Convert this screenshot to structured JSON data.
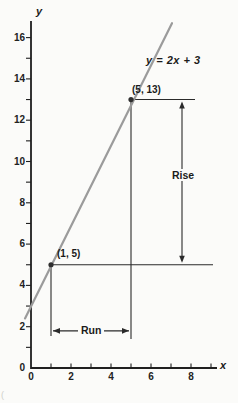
{
  "figure": {
    "background": "#fbfbf9",
    "caption_fragment": "(",
    "labels": {
      "equation": "y = 2x + 3",
      "point_upper": "(5, 13)",
      "point_lower": "(1, 5)",
      "rise": "Rise",
      "run": "Run",
      "x_axis_letter": "x",
      "y_axis_letter": "y"
    }
  },
  "chart_data": {
    "type": "line",
    "title": "",
    "equation": "y = 2x + 3",
    "slope": 2,
    "y_intercept": 3,
    "rise_value": 8,
    "run_value": 4,
    "points": [
      {
        "x": 1,
        "y": 5,
        "label": "(1, 5)"
      },
      {
        "x": 5,
        "y": 13,
        "label": "(5, 13)"
      }
    ],
    "line_segment": {
      "x1": -0.3,
      "y1": 2.4,
      "x2": 7.05,
      "y2": 16.7
    },
    "x_axis": {
      "label": "x",
      "range": [
        0,
        9.3
      ],
      "tick_step": 1,
      "labeled_ticks": [
        "0",
        "2",
        "4",
        "6",
        "8"
      ]
    },
    "y_axis": {
      "label": "y",
      "range": [
        0,
        16.8
      ],
      "tick_step": 1,
      "labeled_ticks": [
        "0",
        "2",
        "4",
        "6",
        "8",
        "10",
        "12",
        "14",
        "16"
      ]
    },
    "grid": false,
    "legend": false,
    "annotations": {
      "rise_arrow": {
        "label": "Rise",
        "x": 7.55,
        "y1": 5.2,
        "y2": 12.8
      },
      "run_arrow": {
        "label": "Run",
        "y": 1.8,
        "x1": 1.1,
        "x2": 4.9
      },
      "guides": [
        {
          "type": "v",
          "x": 1,
          "y1": 5,
          "y2": 1.55
        },
        {
          "type": "v",
          "x": 5,
          "y1": 13,
          "y2": 1.4
        },
        {
          "type": "h",
          "y": 5,
          "x1": 1,
          "x2": 9.1
        },
        {
          "type": "h",
          "y": 13,
          "x1": 5,
          "x2": 8.2
        }
      ]
    },
    "colors": {
      "function_line": "#9b9b9b",
      "axis": "#1f1f1f",
      "annotation": "#2a2a2a",
      "point": "#2f2f2f",
      "text": "#1b1b1b"
    }
  }
}
